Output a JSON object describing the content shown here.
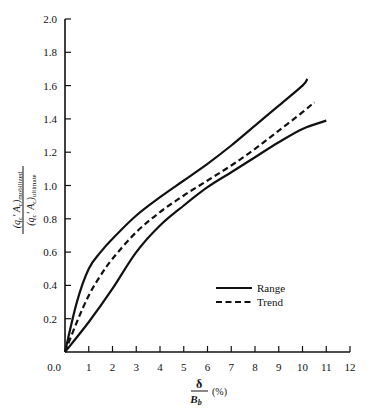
{
  "chart_data": {
    "type": "line",
    "title": "",
    "xlabel": "δ / B_b (%)",
    "xlabel_numerator": "δ",
    "xlabel_denominator": "B",
    "xlabel_denominator_sub": "b",
    "xlabel_unit": "(%)",
    "ylabel": "(q_c' A_c)_mobilized / (q_c' A_c)_ultimate",
    "ylabel_numerator": "(q′ Aₑ)mobilized",
    "ylabel_numerator_main": "(q",
    "ylabel_numerator_sub1": "c",
    "ylabel_numerator_mid": "′ A",
    "ylabel_numerator_sub2": "c",
    "ylabel_numerator_end": ")",
    "ylabel_numerator_tail": "mobilized",
    "ylabel_denominator_tail": "ultimate",
    "xlim": [
      0,
      12
    ],
    "ylim": [
      0,
      2.0
    ],
    "x_ticks": [
      "1",
      "2",
      "3",
      "4",
      "5",
      "6",
      "7",
      "8",
      "9",
      "10",
      "11",
      "12"
    ],
    "y_ticks": [
      "0.0",
      "0.2",
      "0.4",
      "0.6",
      "0.8",
      "1.0",
      "1.2",
      "1.4",
      "1.6",
      "1.8",
      "2.0"
    ],
    "grid": false,
    "legend_position": "lower right",
    "legend": [
      {
        "label": "Range",
        "style": "solid"
      },
      {
        "label": "Trend",
        "style": "dashed"
      }
    ],
    "series": [
      {
        "name": "Range (upper)",
        "style": "solid",
        "points": [
          [
            0,
            0
          ],
          [
            0.5,
            0.3
          ],
          [
            1,
            0.5
          ],
          [
            1.5,
            0.6
          ],
          [
            2,
            0.68
          ],
          [
            3,
            0.82
          ],
          [
            4,
            0.93
          ],
          [
            5,
            1.03
          ],
          [
            6,
            1.13
          ],
          [
            7,
            1.24
          ],
          [
            8,
            1.36
          ],
          [
            9,
            1.48
          ],
          [
            10,
            1.6
          ],
          [
            10.2,
            1.64
          ]
        ]
      },
      {
        "name": "Trend",
        "style": "dashed",
        "points": [
          [
            0,
            0
          ],
          [
            0.5,
            0.18
          ],
          [
            1,
            0.34
          ],
          [
            1.5,
            0.46
          ],
          [
            2,
            0.56
          ],
          [
            3,
            0.72
          ],
          [
            4,
            0.84
          ],
          [
            5,
            0.94
          ],
          [
            6,
            1.03
          ],
          [
            7,
            1.12
          ],
          [
            8,
            1.22
          ],
          [
            9,
            1.33
          ],
          [
            10,
            1.44
          ],
          [
            10.5,
            1.5
          ]
        ]
      },
      {
        "name": "Range (lower)",
        "style": "solid",
        "points": [
          [
            0,
            0
          ],
          [
            1,
            0.18
          ],
          [
            2,
            0.38
          ],
          [
            3,
            0.6
          ],
          [
            4,
            0.76
          ],
          [
            5,
            0.88
          ],
          [
            6,
            0.99
          ],
          [
            7,
            1.08
          ],
          [
            8,
            1.17
          ],
          [
            9,
            1.26
          ],
          [
            10,
            1.34
          ],
          [
            11,
            1.39
          ]
        ]
      }
    ]
  }
}
